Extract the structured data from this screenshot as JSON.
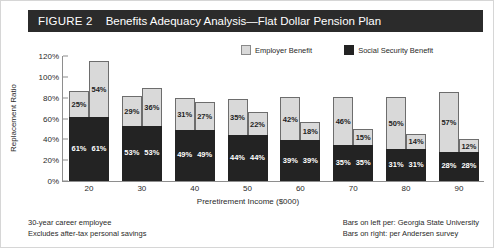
{
  "figure": {
    "number_label": "FIGURE 2",
    "title": "Benefits Adequacy Analysis—Flat Dollar Pension Plan"
  },
  "legend": {
    "items": [
      {
        "label": "Employer Benefit",
        "color": "#d9d9d9",
        "swatch": "employer-swatch"
      },
      {
        "label": "Social Security Benefit",
        "color": "#232323",
        "swatch": "social-security-swatch"
      }
    ]
  },
  "footnotes": {
    "left": [
      "30-year career employee",
      "Excludes after-tax personal savings"
    ],
    "right": [
      "Bars on left per: Georgia State University",
      "Bars on right: per Andersen survey"
    ]
  },
  "chart_data": {
    "type": "bar",
    "stacked": true,
    "grouped": true,
    "title": "Benefits Adequacy Analysis—Flat Dollar Pension Plan",
    "xlabel": "Preretirement Income ($000)",
    "ylabel": "Replacement Ratio",
    "categories": [
      "20",
      "30",
      "40",
      "50",
      "60",
      "70",
      "80",
      "90"
    ],
    "ylim": [
      0,
      120
    ],
    "yticks": [
      0,
      20,
      40,
      60,
      80,
      100,
      120
    ],
    "ytick_labels": [
      "0%",
      "20%",
      "40%",
      "60%",
      "80%",
      "100%",
      "120%"
    ],
    "grid": false,
    "legend_position": "top-right",
    "bar_groups": [
      {
        "source": "Georgia State University",
        "position": "left",
        "series": [
          {
            "name": "Social Security Benefit",
            "values": [
              61,
              53,
              49,
              44,
              39,
              35,
              31,
              28
            ],
            "labels": [
              "61%",
              "53%",
              "49%",
              "44%",
              "39%",
              "35%",
              "31%",
              "28%"
            ],
            "color": "#232323"
          },
          {
            "name": "Employer Benefit",
            "values": [
              25,
              29,
              31,
              35,
              42,
              46,
              50,
              57
            ],
            "labels": [
              "25%",
              "29%",
              "31%",
              "35%",
              "42%",
              "46%",
              "50%",
              "57%"
            ],
            "color": "#d9d9d9"
          }
        ],
        "totals": [
          86,
          82,
          80,
          79,
          81,
          81,
          81,
          85
        ]
      },
      {
        "source": "Andersen survey",
        "position": "right",
        "series": [
          {
            "name": "Social Security Benefit",
            "values": [
              61,
              53,
              49,
              44,
              39,
              35,
              31,
              28
            ],
            "labels": [
              "61%",
              "53%",
              "49%",
              "44%",
              "39%",
              "35%",
              "31%",
              "28%"
            ],
            "color": "#232323"
          },
          {
            "name": "Employer Benefit",
            "values": [
              54,
              36,
              27,
              22,
              18,
              15,
              14,
              12
            ],
            "labels": [
              "54%",
              "36%",
              "27%",
              "22%",
              "18%",
              "15%",
              "14%",
              "12%"
            ],
            "color": "#d9d9d9"
          }
        ],
        "totals": [
          115,
          89,
          76,
          66,
          57,
          50,
          45,
          40
        ]
      }
    ]
  }
}
